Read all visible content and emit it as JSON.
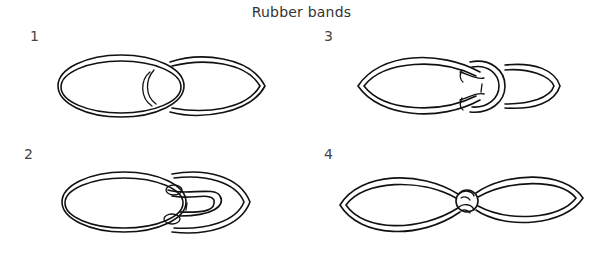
{
  "title": "Rubber bands",
  "steps": [
    {
      "number": "1",
      "description": "Two bands overlapping"
    },
    {
      "number": "2",
      "description": "Right band passed through left band and folded back"
    },
    {
      "number": "3",
      "description": "Loop pulled over the end of the left band"
    },
    {
      "number": "4",
      "description": "Pulled tight into a knot joining both bands"
    }
  ],
  "colors": {
    "ink": "#111111",
    "background": "#ffffff",
    "text": "#333333"
  }
}
